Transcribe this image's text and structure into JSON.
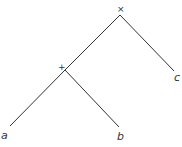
{
  "tree": {
    "root": {
      "operator": "×"
    },
    "inner": {
      "operator": "+"
    },
    "leaves": {
      "a": "a",
      "b": "b",
      "c": "c"
    }
  },
  "colors": {
    "line": "#333333",
    "background": "#ffffff"
  }
}
